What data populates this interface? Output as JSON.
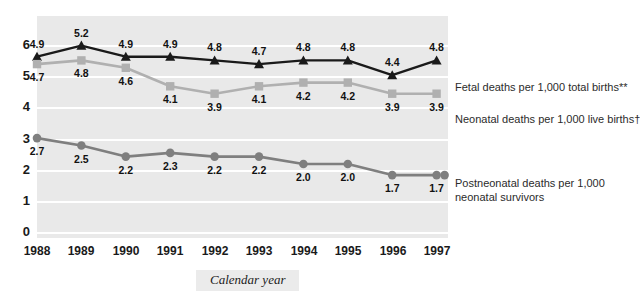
{
  "chart_data": {
    "type": "line",
    "title": "",
    "xlabel": "Calendar year",
    "ylabel": "",
    "categories": [
      "1988",
      "1989",
      "1990",
      "1991",
      "1992",
      "1993",
      "1994",
      "1995",
      "1996",
      "1997"
    ],
    "ylim": [
      0,
      6
    ],
    "yticks": [
      "0",
      "1",
      "2",
      "3",
      "4",
      "5",
      "6"
    ],
    "grid": true,
    "legend_position": "right",
    "series": [
      {
        "name": "Fetal deaths per 1,000 total births**",
        "marker": "triangle",
        "color": "#1a1a1a",
        "label_position": "above",
        "values": [
          4.9,
          5.2,
          4.9,
          4.9,
          4.8,
          4.7,
          4.8,
          4.8,
          4.4,
          4.8
        ],
        "value_labels": [
          "4.9",
          "5.2",
          "4.9",
          "4.9",
          "4.8",
          "4.7",
          "4.8",
          "4.8",
          "4.4",
          "4.8"
        ]
      },
      {
        "name": "Neonatal deaths per 1,000 live births†",
        "marker": "square",
        "color": "#b0b0b0",
        "label_position": "below",
        "values": [
          4.7,
          4.8,
          4.6,
          4.1,
          3.9,
          4.1,
          4.2,
          4.2,
          3.9,
          3.9
        ],
        "value_labels": [
          "4.7",
          "4.8",
          "4.6",
          "4.1",
          "3.9",
          "4.1",
          "4.2",
          "4.2",
          "3.9",
          "3.9"
        ]
      },
      {
        "name": "Postneonatal deaths per 1,000 neonatal survivors",
        "marker": "circle",
        "color": "#7f7f7f",
        "label_position": "below",
        "values": [
          2.7,
          2.5,
          2.2,
          2.3,
          2.2,
          2.2,
          2.0,
          2.0,
          1.7,
          1.7
        ],
        "value_labels": [
          "2.7",
          "2.5",
          "2.2",
          "2.3",
          "2.2",
          "2.2",
          "2.0",
          "2.0",
          "1.7",
          "1.7"
        ]
      }
    ]
  },
  "legend": {
    "fetal": "Fetal deaths per 1,000 total births**",
    "neonatal": "Neonatal deaths per 1,000 live births†",
    "postneonatal_line1": "Postneonatal deaths per 1,000",
    "postneonatal_line2": "neonatal survivors"
  },
  "axis": {
    "x_title": "Calendar year"
  },
  "colors": {
    "panel": "#e9e9e9",
    "gridline": "#ffffff",
    "fetal": "#1a1a1a",
    "neonatal": "#b0b0b0",
    "postneonatal": "#7f7f7f",
    "text": "#1a1a1a"
  }
}
